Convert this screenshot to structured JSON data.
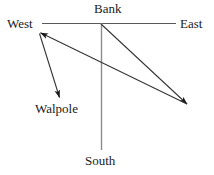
{
  "diagram": {
    "type": "vector-direction-diagram",
    "canvas": {
      "width": 214,
      "height": 175,
      "background": "#ffffff"
    },
    "stroke_color": "#4d4d4d",
    "arrow_color": "#1a1a1a",
    "text_color": "#1a1a1a",
    "nodes": [
      {
        "id": "west",
        "label": "West",
        "x": 39,
        "y": 23
      },
      {
        "id": "bank",
        "label": "Bank",
        "x": 101,
        "y": 23
      },
      {
        "id": "east",
        "label": "East",
        "x": 176,
        "y": 23
      },
      {
        "id": "walpole",
        "label": "Walpole",
        "x": 60,
        "y": 99
      },
      {
        "id": "south",
        "label": "South",
        "x": 101,
        "y": 150
      }
    ],
    "axes": [
      {
        "id": "west-east-axis",
        "from": [
          42,
          23
        ],
        "to": [
          176,
          23
        ],
        "arrow": "none"
      },
      {
        "id": "bank-south-axis",
        "from": [
          101,
          23
        ],
        "to": [
          101,
          150
        ],
        "arrow": "none"
      }
    ],
    "vectors": [
      {
        "id": "bank-to-southeast",
        "from": [
          101,
          23
        ],
        "to": [
          188,
          105
        ],
        "arrow": "end"
      },
      {
        "id": "southeast-to-northwest",
        "from": [
          188,
          105
        ],
        "to": [
          39,
          32
        ],
        "arrow": "end"
      },
      {
        "id": "northwest-to-walpole",
        "from": [
          39,
          32
        ],
        "to": [
          60,
          99
        ],
        "arrow": "end"
      }
    ]
  }
}
